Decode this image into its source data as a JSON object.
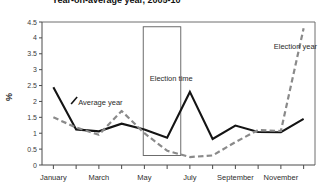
{
  "chart_data": {
    "type": "line",
    "title": "Year-on-average year, 2005-10",
    "xlabel": "",
    "ylabel": "%",
    "ylim": [
      0,
      4.5
    ],
    "ytick_step": 0.5,
    "yticks": [
      "0",
      "0.5",
      "1",
      "1.5",
      "2",
      "2.5",
      "3",
      "3.5",
      "4",
      "4.5"
    ],
    "grid": false,
    "legend_position": "inline-annotation",
    "categories": [
      "January",
      "February",
      "March",
      "April",
      "May",
      "June",
      "July",
      "August",
      "September",
      "October",
      "November",
      "December"
    ],
    "xtick_labels": [
      "January",
      "March",
      "May",
      "July",
      "September",
      "November"
    ],
    "xtick_label_indices": [
      0,
      2,
      4,
      6,
      8,
      10
    ],
    "series": [
      {
        "name": "Average year",
        "style": "solid",
        "color": "#141414",
        "values": [
          2.45,
          1.12,
          1.06,
          1.3,
          1.12,
          0.86,
          2.3,
          0.82,
          1.24,
          1.04,
          1.03,
          1.45
        ]
      },
      {
        "name": "Election year",
        "style": "dashed",
        "color": "#8a8a8a",
        "values": [
          1.5,
          1.18,
          0.95,
          1.7,
          1.0,
          0.45,
          0.25,
          0.3,
          0.72,
          1.1,
          1.07,
          4.3
        ]
      }
    ],
    "annotations": [
      {
        "name": "average-year",
        "text": "Average year",
        "x_month": 1.0,
        "y_value": 2.2,
        "pointer": true
      },
      {
        "name": "election-time",
        "text": "Election time",
        "x_month": 4.15,
        "y_value": 2.95,
        "pointer": false
      },
      {
        "name": "election-year",
        "text": "Election year",
        "x_month": 9.6,
        "y_value": 3.95,
        "pointer": false
      }
    ],
    "boxes": [
      {
        "name": "election-time-box",
        "x_start_month": 3.95,
        "x_end_month": 5.6,
        "y_bottom": 0.3,
        "y_top": 4.35
      }
    ]
  }
}
